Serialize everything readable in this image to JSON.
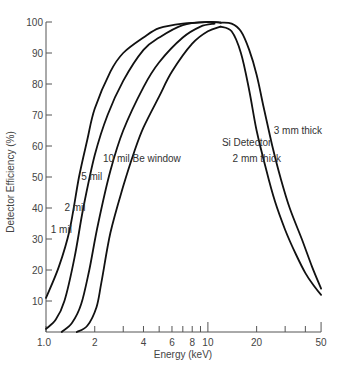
{
  "chart_data": {
    "type": "line",
    "title": "",
    "xlabel": "Energy (keV)",
    "ylabel": "Detector Efficiency (%)",
    "xscale": "log",
    "xlim": [
      1.0,
      50
    ],
    "ylim": [
      0,
      100
    ],
    "grid": false,
    "x_ticks": [
      1.0,
      2,
      4,
      6,
      8,
      10,
      20,
      50
    ],
    "x_tick_labels": [
      "1.0",
      "2",
      "4",
      "6",
      "8",
      "10",
      "20",
      "50"
    ],
    "x_minor_ticks": [
      3,
      5,
      7,
      9,
      30,
      40
    ],
    "y_ticks": [
      10,
      20,
      30,
      40,
      50,
      60,
      70,
      80,
      90,
      100
    ],
    "y_tick_labels": [
      "10",
      "20",
      "30",
      "40",
      "50",
      "60",
      "70",
      "80",
      "90",
      "100"
    ],
    "series": [
      {
        "name": "1 mil",
        "points": [
          [
            1.0,
            11
          ],
          [
            1.2,
            21
          ],
          [
            1.4,
            33
          ],
          [
            1.6,
            50
          ],
          [
            1.8,
            62
          ],
          [
            2.0,
            72
          ],
          [
            2.5,
            84
          ],
          [
            3,
            90
          ],
          [
            4,
            95
          ],
          [
            5,
            98
          ],
          [
            7,
            99.5
          ],
          [
            10,
            100
          ],
          [
            12,
            99.8
          ]
        ]
      },
      {
        "name": "2 mil",
        "points": [
          [
            1.0,
            1
          ],
          [
            1.15,
            4
          ],
          [
            1.3,
            10
          ],
          [
            1.5,
            24
          ],
          [
            1.7,
            40
          ],
          [
            2.0,
            57
          ],
          [
            2.4,
            70
          ],
          [
            3,
            81
          ],
          [
            4,
            91
          ],
          [
            5,
            95
          ],
          [
            7,
            99
          ],
          [
            10,
            100
          ],
          [
            12,
            99.8
          ]
        ]
      },
      {
        "name": "5 mil",
        "points": [
          [
            1.25,
            0
          ],
          [
            1.45,
            3
          ],
          [
            1.65,
            9
          ],
          [
            1.85,
            20
          ],
          [
            2.1,
            35
          ],
          [
            2.5,
            52
          ],
          [
            3,
            65
          ],
          [
            4,
            79
          ],
          [
            5,
            87
          ],
          [
            7,
            95
          ],
          [
            9,
            98.5
          ],
          [
            11,
            99.5
          ]
        ]
      },
      {
        "name": "10 mil Be window",
        "points": [
          [
            1.55,
            0
          ],
          [
            1.8,
            2
          ],
          [
            2.05,
            8
          ],
          [
            2.2,
            16
          ],
          [
            2.5,
            32
          ],
          [
            3,
            47
          ],
          [
            3.5,
            58
          ],
          [
            4,
            66
          ],
          [
            5,
            76
          ],
          [
            6,
            84
          ],
          [
            8,
            93
          ],
          [
            10,
            97
          ],
          [
            12,
            98.5
          ]
        ]
      },
      {
        "name": "Si Detector 2 mm thick",
        "points": [
          [
            12,
            98.5
          ],
          [
            14,
            97
          ],
          [
            16,
            90
          ],
          [
            18,
            78
          ],
          [
            20,
            65
          ],
          [
            23,
            52
          ],
          [
            26,
            42
          ],
          [
            30,
            33
          ],
          [
            35,
            25
          ],
          [
            40,
            19
          ],
          [
            45,
            15
          ],
          [
            50,
            12
          ]
        ]
      },
      {
        "name": "Si Detector 3 mm thick",
        "points": [
          [
            12,
            99.8
          ],
          [
            14,
            99.5
          ],
          [
            16,
            97
          ],
          [
            18,
            91
          ],
          [
            20,
            83
          ],
          [
            22,
            73
          ],
          [
            25,
            60
          ],
          [
            28,
            50
          ],
          [
            32,
            40
          ],
          [
            38,
            30
          ],
          [
            44,
            21
          ],
          [
            50,
            14
          ]
        ]
      }
    ],
    "annotations": [
      {
        "text": "1 mil",
        "x": 1.07,
        "y": 32
      },
      {
        "text": "2 mil",
        "x": 1.3,
        "y": 39
      },
      {
        "text": "5 mil",
        "x": 1.65,
        "y": 49
      },
      {
        "text": "10 mil Be window",
        "x": 2.25,
        "y": 55
      },
      {
        "text": "Si Detector",
        "x": 12.2,
        "y": 60
      },
      {
        "text": "3 mm thick",
        "x": 25.5,
        "y": 64
      },
      {
        "text": "2 mm thick",
        "x": 14.2,
        "y": 55
      }
    ]
  },
  "labels": {
    "xlabel": "Energy (keV)",
    "ylabel": "Detector Efficiency (%)"
  }
}
